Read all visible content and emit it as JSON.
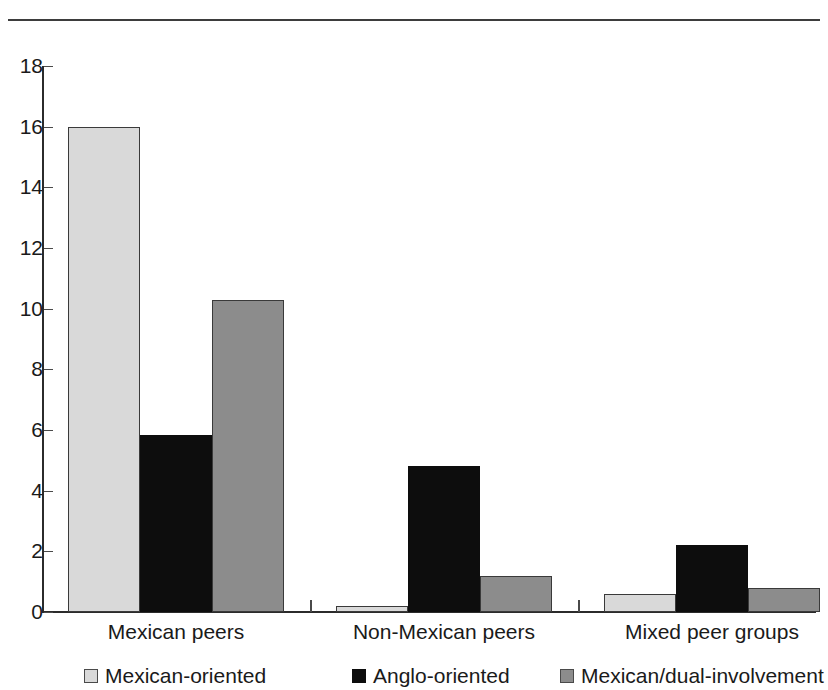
{
  "top_caption": "",
  "chart_data": {
    "type": "bar",
    "title": "",
    "xlabel": "",
    "ylabel": "",
    "ylim": [
      0,
      18
    ],
    "ytick_step": 2,
    "yticks": [
      "18",
      "16",
      "14",
      "12",
      "10",
      "8",
      "6",
      "4",
      "2",
      "0"
    ],
    "grid": false,
    "legend_position": "bottom",
    "categories": [
      "Mexican peers",
      "Non-Mexican peers",
      "Mixed peer groups"
    ],
    "series": [
      {
        "name": "Mexican-oriented",
        "color": "#d9d9d9",
        "values": [
          16.0,
          0.2,
          0.6
        ]
      },
      {
        "name": "Anglo-oriented",
        "color": "#0d0d0d",
        "values": [
          5.85,
          4.8,
          2.2
        ]
      },
      {
        "name": "Mexican/dual-involvement",
        "color": "#8c8c8c",
        "values": [
          10.3,
          1.2,
          0.8
        ]
      }
    ]
  }
}
